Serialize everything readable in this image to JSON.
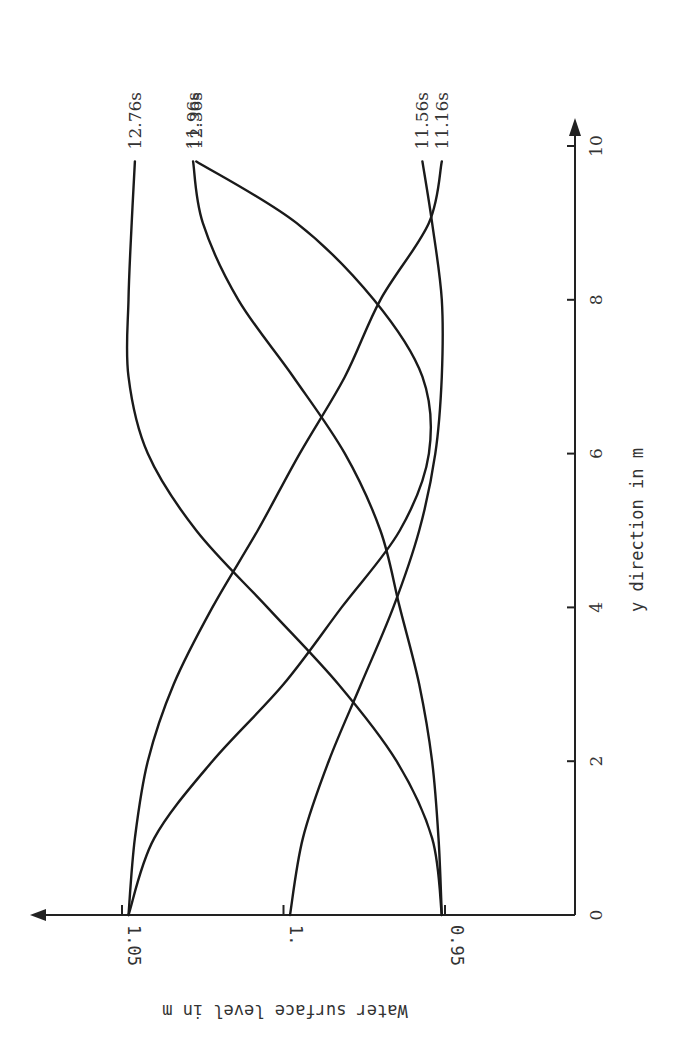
{
  "chart_data": {
    "type": "line",
    "title": "",
    "orientation": "rotated 90 degrees clockwise (x-axis vertical, y-axis horizontal)",
    "xlabel": "y direction in m",
    "ylabel": "Water surface level in m",
    "xlim": [
      0,
      10
    ],
    "ylim": [
      0.95,
      1.05
    ],
    "x_ticks": [
      "0",
      "2",
      "4",
      "6",
      "8",
      "10"
    ],
    "y_ticks": [
      "0.95",
      "1.",
      "1.05"
    ],
    "grid": false,
    "legend": "inline labels at curve ends",
    "x": [
      0,
      1,
      2,
      3,
      4,
      5,
      6,
      7,
      8,
      9,
      9.8
    ],
    "series": [
      {
        "name": "12.76s",
        "values": [
          0.951,
          0.954,
          0.965,
          0.983,
          1.005,
          1.027,
          1.042,
          1.048,
          1.048,
          1.047,
          1.046
        ]
      },
      {
        "name": "12.36s",
        "values": [
          1.048,
          1.04,
          1.022,
          1.0,
          0.982,
          0.964,
          0.955,
          0.957,
          0.972,
          0.996,
          1.027
        ]
      },
      {
        "name": "11.16s",
        "values": [
          1.048,
          1.046,
          1.042,
          1.034,
          1.022,
          1.008,
          0.995,
          0.981,
          0.97,
          0.955,
          0.951
        ]
      },
      {
        "name": "11.96s",
        "values": [
          0.951,
          0.952,
          0.954,
          0.958,
          0.964,
          0.97,
          0.981,
          0.997,
          1.014,
          1.025,
          1.028
        ]
      },
      {
        "name": "11.56s",
        "values": [
          0.998,
          0.994,
          0.986,
          0.976,
          0.966,
          0.958,
          0.953,
          0.951,
          0.951,
          0.954,
          0.957
        ]
      }
    ]
  },
  "axis": {
    "x_label": "y direction in m",
    "y_label": "Water surface level in m",
    "x_ticks": [
      {
        "label": "0",
        "value": 0
      },
      {
        "label": "2",
        "value": 2
      },
      {
        "label": "4",
        "value": 4
      },
      {
        "label": "6",
        "value": 6
      },
      {
        "label": "8",
        "value": 8
      },
      {
        "label": "10",
        "value": 10
      }
    ],
    "y_ticks": [
      {
        "label": "1.05",
        "value": 1.05
      },
      {
        "label": "1.",
        "value": 1.0
      },
      {
        "label": "0.95",
        "value": 0.95
      }
    ]
  },
  "legend": {
    "labels": [
      "12.76s",
      "12.36s",
      "11.16s",
      "11.96s",
      "11.56s"
    ]
  }
}
